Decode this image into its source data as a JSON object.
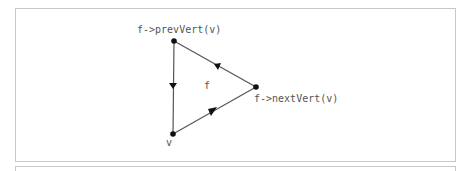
{
  "diagram": {
    "face_label": "f",
    "vertices": {
      "v": {
        "label": "v",
        "x": 173,
        "y": 134
      },
      "prev": {
        "label": "f->prevVert(v)",
        "x": 174,
        "y": 41
      },
      "next": {
        "label": "f->nextVert(v)",
        "x": 256,
        "y": 87
      }
    },
    "edges": [
      {
        "from": "prev",
        "to": "v",
        "arrow": "down"
      },
      {
        "from": "v",
        "to": "next",
        "arrow": "toward next"
      },
      {
        "from": "next",
        "to": "prev",
        "arrow": "toward prev"
      }
    ],
    "colors": {
      "edge": "#555555",
      "vertex": "#111111",
      "text": "#555555",
      "border": "#c8c8c8"
    }
  }
}
